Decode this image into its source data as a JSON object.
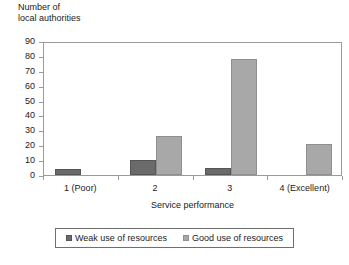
{
  "chart_data": {
    "type": "bar",
    "title": "",
    "ylabel_line1": "Number of",
    "ylabel_line2": "local authorities",
    "xlabel": "Service performance",
    "categories": [
      "1 (Poor)",
      "2",
      "3",
      "4 (Excellent)"
    ],
    "series": [
      {
        "name": "Weak use of resources",
        "color": "#6a6a6a",
        "values": [
          4,
          10,
          5,
          0
        ]
      },
      {
        "name": "Good use of resources",
        "color": "#a8a8a8",
        "values": [
          0,
          26,
          78,
          21
        ]
      }
    ],
    "ylim": [
      0,
      90
    ],
    "ytick_step": 10,
    "yticks": [
      90,
      80,
      70,
      60,
      50,
      40,
      30,
      20,
      10,
      0
    ],
    "ytick_labels": [
      "90",
      "80",
      "70",
      "60",
      "50",
      "40",
      "30",
      "20",
      "10",
      "0"
    ],
    "grid": false,
    "legend_position": "bottom"
  }
}
